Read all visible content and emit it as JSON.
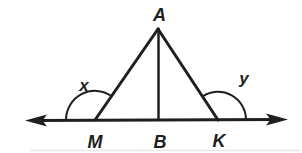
{
  "figure": {
    "labels": {
      "apex": "A",
      "base_left": "M",
      "base_mid": "B",
      "base_right": "K",
      "angle_left": "x",
      "angle_right": "y"
    },
    "colors": {
      "ink": "#1f1f1f",
      "background": "#ffffff",
      "scan_artifact": "#d9d9d9"
    }
  }
}
